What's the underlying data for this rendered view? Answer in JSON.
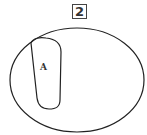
{
  "figure": {
    "number_label": "2"
  },
  "diagram": {
    "type": "venn",
    "universe": {
      "shape": "ellipse"
    },
    "sets": [
      {
        "label": "A",
        "shape": "rounded-rectangle",
        "position": "left, inside universe touching top-left edge"
      }
    ]
  }
}
